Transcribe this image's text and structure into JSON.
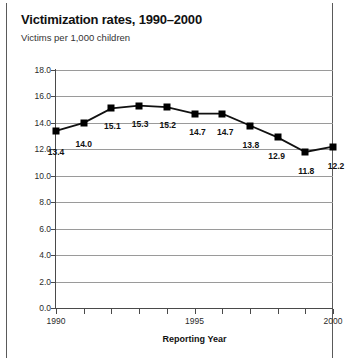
{
  "figure": {
    "title": "Victimization rates, 1990–2000",
    "subtitle": "Victims per 1,000 children",
    "border_color": "#5a5a5a",
    "background": "#ffffff"
  },
  "chart_data": {
    "type": "line",
    "title": "Victimization rates, 1990–2000",
    "subtitle": "Victims per 1,000 children",
    "xlabel": "Reporting Year",
    "ylabel": "",
    "x": [
      1990,
      1991,
      1992,
      1993,
      1994,
      1995,
      1996,
      1997,
      1998,
      1999,
      2000
    ],
    "values": [
      13.4,
      14.0,
      15.1,
      15.3,
      15.2,
      14.7,
      14.7,
      13.8,
      12.9,
      11.8,
      12.2
    ],
    "point_labels": [
      "13.4",
      "14.0",
      "15.1",
      "15.3",
      "15.2",
      "14.7",
      "14.7",
      "13.8",
      "12.9",
      "11.8",
      "12.2"
    ],
    "xlim": [
      1990,
      2000
    ],
    "ylim": [
      0.0,
      18.0
    ],
    "yticks": [
      18.0,
      16.0,
      14.0,
      12.0,
      10.0,
      8.0,
      6.0,
      4.0,
      2.0,
      0.0
    ],
    "ytick_labels": [
      "18.0",
      "16.0",
      "14.0",
      "12.0",
      "10.0",
      "8.0",
      "6.0",
      "4.0",
      "2.0",
      "0.0"
    ],
    "xticks": [
      1990,
      1991,
      1992,
      1993,
      1994,
      1995,
      1996,
      1997,
      1998,
      1999,
      2000
    ],
    "xtick_labels_shown": [
      {
        "x": 1990,
        "label": "1990"
      },
      {
        "x": 1995,
        "label": "1995"
      },
      {
        "x": 2000,
        "label": "2000"
      }
    ],
    "grid": "horizontal",
    "grid_color": "#9a9a9a",
    "line_color": "#111111",
    "marker": "square",
    "marker_color": "#000000",
    "legend": null
  }
}
